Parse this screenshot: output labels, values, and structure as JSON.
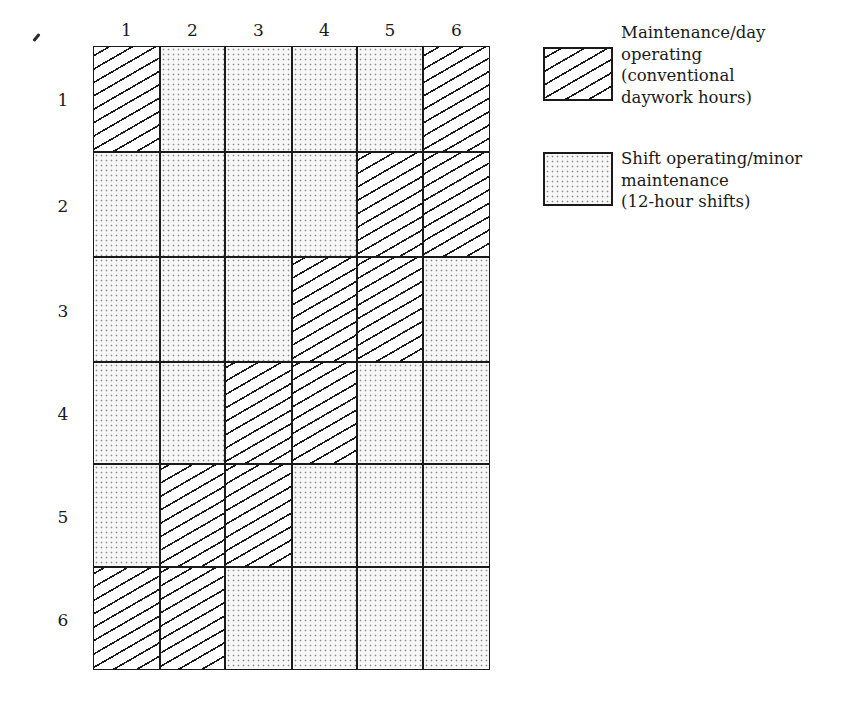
{
  "diagram": {
    "type": "shift-rotation-grid",
    "column_labels": [
      "1",
      "2",
      "3",
      "4",
      "5",
      "6"
    ],
    "row_labels": [
      "1",
      "2",
      "3",
      "4",
      "5",
      "6"
    ],
    "cell_key": {
      "H": "Maintenance/day operating (conventional daywork hours)",
      "D": "Shift operating/minor maintenance (12-hour shifts)"
    },
    "rows": [
      [
        "H",
        "D",
        "D",
        "D",
        "D",
        "H"
      ],
      [
        "D",
        "D",
        "D",
        "D",
        "H",
        "H"
      ],
      [
        "D",
        "D",
        "D",
        "H",
        "H",
        "D"
      ],
      [
        "D",
        "D",
        "H",
        "H",
        "D",
        "D"
      ],
      [
        "D",
        "H",
        "H",
        "D",
        "D",
        "D"
      ],
      [
        "H",
        "H",
        "D",
        "D",
        "D",
        "D"
      ]
    ]
  },
  "legend": {
    "items": [
      {
        "pattern": "hatch",
        "label": "Maintenance/day\noperating\n(conventional\ndaywork hours)"
      },
      {
        "pattern": "dots",
        "label": "Shift operating/minor\nmaintenance\n(12-hour shifts)"
      }
    ]
  },
  "colors": {
    "ink": "#1a1a1a",
    "dot": "#8a8a8a",
    "paper": "#ffffff"
  }
}
